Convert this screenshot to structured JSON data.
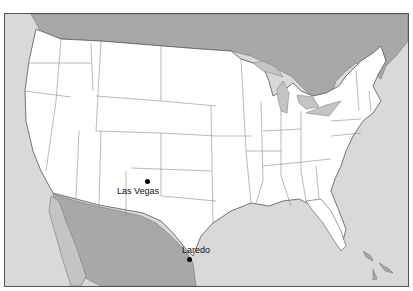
{
  "map": {
    "type": "outline-map",
    "region": "Contiguous United States",
    "colors": {
      "land_us": "#ffffff",
      "land_other": "#a8a8a8",
      "water": "#d9d9d9",
      "border": "#666666"
    },
    "cities": [
      {
        "name": "Las Vegas",
        "x": 146,
        "y": 180,
        "label_x": 116,
        "label_y": 183
      },
      {
        "name": "Laredo",
        "x": 188,
        "y": 258,
        "label_x": 180,
        "label_y": 245
      }
    ]
  }
}
